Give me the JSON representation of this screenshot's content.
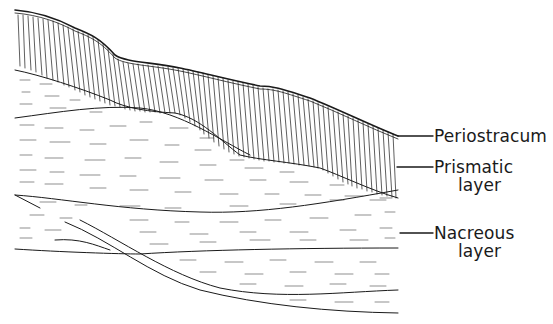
{
  "figure": {
    "colors": {
      "ink": "#1a1a1a",
      "background": "#ffffff"
    }
  },
  "labels": [
    {
      "id": "periostracum",
      "line1": "Periostracum",
      "line2": ""
    },
    {
      "id": "prismatic",
      "line1": "Prismatic",
      "line2": "layer"
    },
    {
      "id": "nacreous",
      "line1": "Nacreous",
      "line2": "layer"
    }
  ]
}
